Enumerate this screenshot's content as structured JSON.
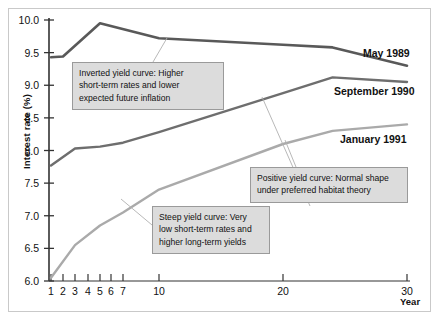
{
  "chart_data": {
    "type": "line",
    "title": "",
    "xlabel": "Year",
    "ylabel": "Interest rate (%)",
    "ylim": [
      6.0,
      10.0
    ],
    "yticks": [
      6.0,
      6.5,
      7.0,
      7.5,
      8.0,
      8.5,
      9.0,
      9.5,
      10.0
    ],
    "ytick_labels": [
      "6.0",
      "6.5",
      "7.0",
      "7.5",
      "8.0",
      "8.5",
      "9.0",
      "9.5",
      "10.0"
    ],
    "xticks": [
      1,
      2,
      3,
      4,
      5,
      6,
      7,
      10,
      20,
      30
    ],
    "xtick_labels": [
      "1",
      "2",
      "3",
      "4",
      "5",
      "6",
      "7",
      "10",
      "20",
      "30"
    ],
    "x_scale": "compressed-maturity",
    "grid": false,
    "legend_position": "inline-right",
    "series": [
      {
        "name": "May 1989",
        "color": "#595959",
        "x": [
          1,
          2,
          5,
          10,
          20,
          24,
          30
        ],
        "y": [
          9.43,
          9.44,
          9.95,
          9.72,
          9.62,
          9.58,
          9.3
        ]
      },
      {
        "name": "September 1990",
        "color": "#6e6e6e",
        "x": [
          1,
          3,
          5,
          7,
          10,
          20,
          24,
          30
        ],
        "y": [
          7.77,
          8.03,
          8.06,
          8.12,
          8.28,
          8.88,
          9.12,
          9.05
        ]
      },
      {
        "name": "January 1991",
        "color": "#aaaaaa",
        "x": [
          1,
          3,
          5,
          7,
          10,
          20,
          24,
          30
        ],
        "y": [
          6.05,
          6.55,
          6.85,
          7.05,
          7.4,
          8.1,
          8.3,
          8.4
        ]
      }
    ],
    "annotations": [
      {
        "id": "inverted",
        "lines": [
          "Inverted yield curve:  Higher",
          "short-term rates and lower",
          "expected future inflation"
        ],
        "points_to_series": "May 1989"
      },
      {
        "id": "positive",
        "lines": [
          "Positive yield curve:  Normal shape",
          "under preferred habitat theory"
        ],
        "points_to_series": "September 1990"
      },
      {
        "id": "steep",
        "lines": [
          "Steep yield curve:  Very",
          "low short-term rates and",
          "higher long-term yields"
        ],
        "points_to_series": "January 1991"
      }
    ]
  },
  "colors": {
    "background": "#ffffff",
    "axis": "#333333",
    "frame": "#c9c9c9",
    "callout_fill": "#dcdcdc",
    "callout_border": "#9a9a9a",
    "leader_line": "#b0b0b0"
  }
}
